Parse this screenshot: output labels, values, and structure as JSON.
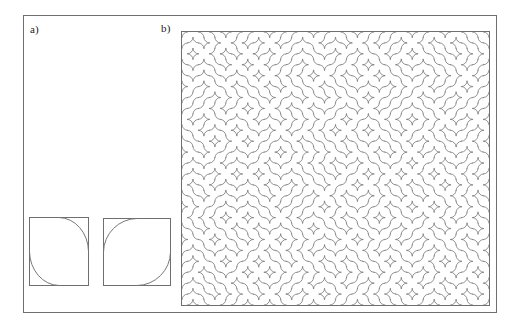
{
  "figure": {
    "width": 510,
    "height": 328,
    "background_color": "#ffffff",
    "frame_color": "#6f6f6f",
    "stroke_color": "#777777"
  },
  "panels": [
    {
      "id": "a",
      "label": "a)",
      "caption": "",
      "description": "Two prototype Truchet tiles with quarter-circle arcs",
      "tiles": [
        {
          "name": "truchet-tile-a",
          "orientation": "ne-sw",
          "arcs": [
            {
              "from": "top-center",
              "to": "right-center",
              "center": "top-right"
            },
            {
              "from": "left-center",
              "to": "bottom-center",
              "center": "bottom-left"
            }
          ]
        },
        {
          "name": "truchet-tile-b",
          "orientation": "nw-se",
          "arcs": [
            {
              "from": "top-center",
              "to": "left-center",
              "center": "top-left"
            },
            {
              "from": "right-center",
              "to": "bottom-center",
              "center": "bottom-right"
            }
          ]
        }
      ]
    },
    {
      "id": "b",
      "label": "b)",
      "caption": "",
      "description": "Random Truchet tiling assembled from the two prototype tiles",
      "tiling": {
        "columns": 28,
        "rows": 25,
        "tile_size": 11,
        "seed": 20240417
      }
    }
  ]
}
